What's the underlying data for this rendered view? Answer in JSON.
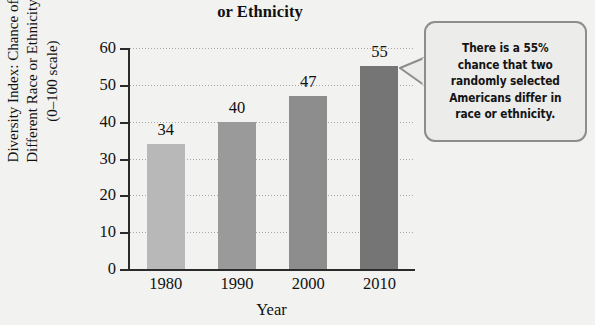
{
  "chart_data": {
    "type": "bar",
    "title": "Americans Are a Different Race or Ethnicity",
    "title_lines": [
      "Americans Are a Different Race",
      "or Ethnicity"
    ],
    "categories": [
      "1980",
      "1990",
      "2000",
      "2010"
    ],
    "values": [
      34,
      40,
      47,
      55
    ],
    "xlabel": "Year",
    "ylabel": "Diversity Index: Chance of Different Race or Ethnicity (0–100 scale)",
    "ylabel_lines": [
      "Diversity Index: Chance of",
      "Different Race or Ethnicity",
      "(0–100 scale)"
    ],
    "ylim": [
      0,
      60
    ],
    "yticks": [
      0,
      10,
      20,
      30,
      40,
      50,
      60
    ],
    "ytick_labels": [
      "0",
      "10",
      "20",
      "30",
      "40",
      "50",
      "60"
    ],
    "grid": "horizontal-dotted",
    "legend": "none",
    "bar_colors": [
      "#b8b8b8",
      "#9a9a9a",
      "#8d8d8d",
      "#757575"
    ],
    "annotation": {
      "text": "There is a 55% chance that two randomly selected Americans differ in race or ethnicity.",
      "lines": [
        "There is a 55%",
        "chance that two",
        "randomly selected",
        "Americans differ in",
        "race or ethnicity."
      ],
      "points_to": "2010",
      "border_color": "#8d8d8d",
      "background_color": "#ececeb"
    }
  },
  "axis_color": "#2b2b2b",
  "background_color": "#f2f2f0"
}
